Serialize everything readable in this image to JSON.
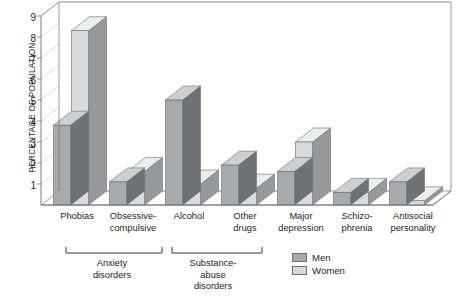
{
  "chart_data": {
    "type": "bar",
    "title": "",
    "subtitle": "",
    "xlabel": "",
    "ylabel": "PERCENTAGE OF POPULATION",
    "ylim": [
      0,
      9
    ],
    "yticks": [
      "1",
      "2",
      "3",
      "4",
      "5",
      "6",
      "7",
      "8",
      "9"
    ],
    "grid": true,
    "legend_position": "bottom-center",
    "style": "3d-bar",
    "categories": [
      "Phobias",
      "Obsessive-\ncompulsive",
      "Alcohol",
      "Other\ndrugs",
      "Major\ndepression",
      "Schizo-\nphrenia",
      "Antisocial\npersonality"
    ],
    "series": [
      {
        "name": "Men",
        "color": "#a7a9ac",
        "values": [
          3.8,
          1.1,
          5.0,
          1.9,
          1.6,
          0.6,
          1.1
        ]
      },
      {
        "name": "Women",
        "color": "#d9dadb",
        "values": [
          8.3,
          1.6,
          1.0,
          0.8,
          3.0,
          0.6,
          0.2
        ]
      }
    ],
    "category_groups": [
      {
        "label": "Anxiety\ndisorders",
        "members": [
          "Phobias",
          "Obsessive-compulsive"
        ]
      },
      {
        "label": "Substance-\nabuse\ndisorders",
        "members": [
          "Alcohol",
          "Other drugs"
        ]
      }
    ]
  },
  "axis": {
    "y_title": "PERCENTAGE OF POPULATION",
    "ticks": [
      {
        "value": 9,
        "label": "9"
      },
      {
        "value": 8,
        "label": "8"
      },
      {
        "value": 7,
        "label": "7"
      },
      {
        "value": 6,
        "label": "6"
      },
      {
        "value": 5,
        "label": "5"
      },
      {
        "value": 4,
        "label": "4"
      },
      {
        "value": 3,
        "label": "3"
      },
      {
        "value": 2,
        "label": "2"
      },
      {
        "value": 1,
        "label": "1"
      }
    ]
  },
  "categories": [
    {
      "line1": "Phobias",
      "line2": ""
    },
    {
      "line1": "Obsessive-",
      "line2": "compulsive"
    },
    {
      "line1": "Alcohol",
      "line2": ""
    },
    {
      "line1": "Other",
      "line2": "drugs"
    },
    {
      "line1": "Major",
      "line2": "depression"
    },
    {
      "line1": "Schizo-",
      "line2": "phrenia"
    },
    {
      "line1": "Antisocial",
      "line2": "personality"
    }
  ],
  "groups": [
    {
      "line1": "Anxiety",
      "line2": "disorders",
      "line3": ""
    },
    {
      "line1": "Substance-",
      "line2": "abuse",
      "line3": "disorders"
    }
  ],
  "legend": {
    "items": [
      {
        "label": "Men",
        "color": "#a7a9ac"
      },
      {
        "label": "Women",
        "color": "#d9dadb"
      }
    ]
  },
  "colors": {
    "men_front": "#a7a9ac",
    "men_top": "#cdcfd1",
    "men_side": "#6f7174",
    "women_front": "#d9dadb",
    "women_top": "#eceded",
    "women_side": "#96989b",
    "gridline": "#c9cacc",
    "frame": "#6d6e71",
    "text": "#231f20"
  }
}
